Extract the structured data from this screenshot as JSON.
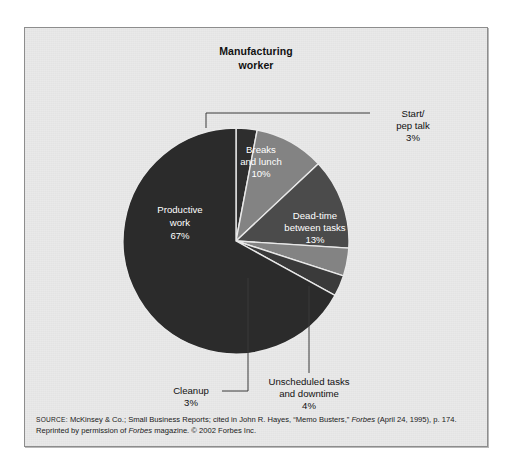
{
  "figure": {
    "title_line1": "Manufacturing",
    "title_line2": "worker",
    "panel_bg": "#e9e9e9",
    "border_color": "#8d8d8d"
  },
  "chart_data": {
    "type": "pie",
    "title": "Manufacturing worker",
    "units": "percent",
    "total": 100,
    "legend": "none (direct labels)",
    "grid": false,
    "categories": [
      "Start/pep talk",
      "Breaks and lunch",
      "Dead-time between tasks",
      "Unscheduled tasks and downtime",
      "Cleanup",
      "Productive work"
    ],
    "values": [
      3,
      10,
      13,
      4,
      3,
      67
    ],
    "slices": [
      {
        "name": "Start/pep talk",
        "label_line1": "Start/",
        "label_line2": "pep talk",
        "value_label": "3%",
        "value": 3,
        "color": "#2e2e2e",
        "label_placement": "callout-right",
        "text_color": "#111111"
      },
      {
        "name": "Breaks and lunch",
        "label_line1": "Breaks",
        "label_line2": "and lunch",
        "value_label": "10%",
        "value": 10,
        "color": "#838383",
        "label_placement": "inside",
        "text_color": "#ffffff"
      },
      {
        "name": "Dead-time between tasks",
        "label_line1": "Dead-time",
        "label_line2": "between tasks",
        "value_label": "13%",
        "value": 13,
        "color": "#4b4b4b",
        "label_placement": "inside",
        "text_color": "#ffffff"
      },
      {
        "name": "Unscheduled tasks and downtime",
        "label_line1": "Unscheduled tasks",
        "label_line2": "and downtime",
        "value_label": "4%",
        "value": 4,
        "color": "#838383",
        "label_placement": "callout-bottom",
        "text_color": "#111111"
      },
      {
        "name": "Cleanup",
        "label_line1": "Cleanup",
        "label_line2": "",
        "value_label": "3%",
        "value": 3,
        "color": "#3a3a3a",
        "label_placement": "callout-bottom",
        "text_color": "#111111"
      },
      {
        "name": "Productive work",
        "label_line1": "Productive",
        "label_line2": "work",
        "value_label": "67%",
        "value": 67,
        "color": "#2b2b2b",
        "label_placement": "inside",
        "text_color": "#ffffff"
      }
    ]
  },
  "source": {
    "prefix": "SOURCE:",
    "text_part1": " McKinsey & Co.; Small Business Reports; cited in John R. Hayes, “Memo Busters,” ",
    "italic1": "Forbes",
    "text_part2": " (April 24, 1995), p. 174. Reprinted by permission of ",
    "italic2": "Forbes",
    "text_part3": " magazine. © 2002 Forbes Inc."
  }
}
